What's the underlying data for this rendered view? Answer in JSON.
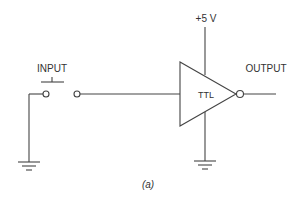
{
  "diagram": {
    "type": "circuit-schematic",
    "labels": {
      "input": "INPUT",
      "output": "OUTPUT",
      "supply": "+5 V",
      "gate": "TTL",
      "caption": "(a)"
    },
    "components": [
      {
        "name": "push-button-switch",
        "label": "INPUT"
      },
      {
        "name": "ttl-inverter",
        "label": "TTL"
      },
      {
        "name": "supply-rail",
        "label": "+5 V"
      },
      {
        "name": "ground-switch"
      },
      {
        "name": "ground-gate"
      }
    ],
    "colors": {
      "line": "#444444",
      "text": "#333333",
      "background": "#ffffff"
    }
  }
}
